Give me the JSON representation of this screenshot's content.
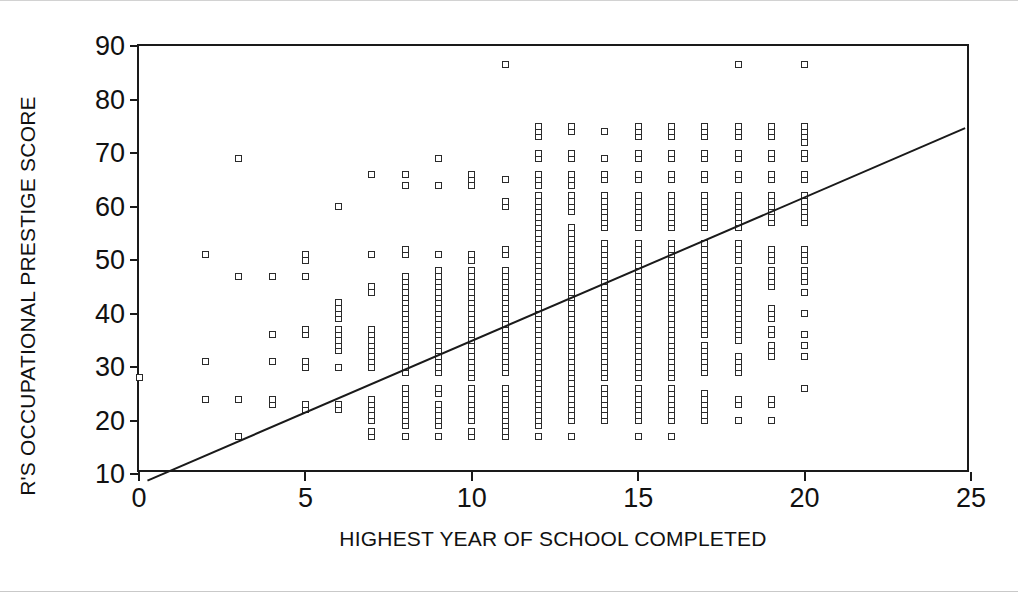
{
  "chart_data": {
    "type": "scatter",
    "title": "",
    "xlabel": "HIGHEST YEAR OF SCHOOL COMPLETED",
    "ylabel": "R'S OCCUPATIONAL PRESTIGE SCORE",
    "xlim": [
      0,
      25
    ],
    "ylim": [
      10,
      90
    ],
    "xticks": [
      0,
      5,
      10,
      15,
      20,
      25
    ],
    "yticks": [
      10,
      20,
      30,
      40,
      50,
      60,
      70,
      80,
      90
    ],
    "grid": false,
    "legend": null,
    "marker": "open-square",
    "marker_color": "#2b2b2b",
    "regression_line": {
      "label": "fit-line",
      "x_start": 0.2,
      "y_start": 8.0,
      "x_end": 25.0,
      "y_end": 74.5,
      "slope": 2.68,
      "intercept": 7.5,
      "color": "#1a1a1a"
    },
    "columns": [
      {
        "x": 0,
        "values": [
          28
        ]
      },
      {
        "x": 2,
        "values": [
          24,
          31,
          51
        ]
      },
      {
        "x": 3,
        "values": [
          17,
          24,
          47,
          69
        ]
      },
      {
        "x": 4,
        "values": [
          23,
          24,
          31,
          36,
          47
        ]
      },
      {
        "x": 5,
        "values": [
          22,
          23,
          30,
          31,
          36,
          37,
          47,
          50,
          51
        ]
      },
      {
        "x": 6,
        "values": [
          22,
          23,
          30,
          33,
          34,
          35,
          36,
          37,
          39,
          40,
          41,
          42,
          60
        ]
      },
      {
        "x": 7,
        "values": [
          17,
          18,
          20,
          21,
          22,
          23,
          24,
          30,
          31,
          32,
          33,
          34,
          35,
          36,
          37,
          44,
          45,
          51,
          66
        ]
      },
      {
        "x": 8,
        "values": [
          17,
          19,
          20,
          21,
          22,
          23,
          24,
          25,
          26,
          29,
          30,
          31,
          32,
          33,
          34,
          35,
          36,
          37,
          38,
          39,
          40,
          41,
          42,
          43,
          44,
          45,
          46,
          47,
          51,
          52,
          64,
          66
        ]
      },
      {
        "x": 9,
        "values": [
          17,
          19,
          20,
          21,
          22,
          23,
          25,
          26,
          29,
          30,
          31,
          32,
          33,
          34,
          35,
          36,
          37,
          38,
          39,
          40,
          41,
          42,
          43,
          44,
          45,
          46,
          47,
          48,
          51,
          64,
          69
        ]
      },
      {
        "x": 10,
        "values": [
          17,
          18,
          20,
          21,
          22,
          23,
          24,
          25,
          26,
          28,
          29,
          30,
          31,
          32,
          33,
          34,
          35,
          36,
          37,
          38,
          39,
          40,
          41,
          42,
          43,
          44,
          45,
          46,
          47,
          48,
          50,
          51,
          64,
          65,
          66
        ]
      },
      {
        "x": 11,
        "values": [
          17,
          18,
          19,
          20,
          21,
          22,
          23,
          24,
          25,
          26,
          29,
          30,
          31,
          32,
          33,
          34,
          35,
          36,
          37,
          38,
          39,
          40,
          41,
          42,
          43,
          44,
          45,
          46,
          47,
          48,
          51,
          52,
          60,
          61,
          65,
          86.5
        ]
      },
      {
        "x": 12,
        "values": [
          17,
          19,
          20,
          21,
          22,
          23,
          24,
          25,
          26,
          27,
          28,
          29,
          30,
          31,
          32,
          33,
          34,
          35,
          36,
          37,
          38,
          39,
          40,
          41,
          42,
          43,
          44,
          45,
          46,
          47,
          48,
          49,
          50,
          51,
          52,
          53,
          54,
          55,
          56,
          57,
          58,
          59,
          60,
          61,
          62,
          64,
          65,
          66,
          69,
          70,
          73,
          74,
          75
        ]
      },
      {
        "x": 13,
        "values": [
          17,
          20,
          21,
          22,
          23,
          24,
          25,
          26,
          27,
          28,
          29,
          30,
          31,
          32,
          33,
          34,
          35,
          36,
          37,
          38,
          39,
          40,
          41,
          42,
          43,
          44,
          45,
          46,
          47,
          48,
          49,
          50,
          51,
          52,
          53,
          54,
          55,
          56,
          59,
          60,
          61,
          62,
          64,
          65,
          66,
          69,
          70,
          74,
          75
        ]
      },
      {
        "x": 14,
        "values": [
          20,
          21,
          22,
          23,
          24,
          25,
          26,
          28,
          29,
          30,
          31,
          32,
          33,
          34,
          35,
          36,
          37,
          38,
          39,
          40,
          41,
          42,
          43,
          44,
          45,
          46,
          47,
          48,
          49,
          50,
          51,
          52,
          53,
          56,
          57,
          58,
          59,
          60,
          61,
          62,
          65,
          66,
          69,
          74
        ]
      },
      {
        "x": 15,
        "values": [
          17,
          20,
          21,
          22,
          23,
          24,
          25,
          26,
          28,
          29,
          30,
          31,
          32,
          33,
          34,
          35,
          36,
          37,
          38,
          39,
          40,
          41,
          42,
          43,
          44,
          45,
          46,
          47,
          48,
          49,
          50,
          51,
          52,
          53,
          56,
          57,
          58,
          59,
          60,
          61,
          62,
          65,
          66,
          69,
          70,
          73,
          74,
          75
        ]
      },
      {
        "x": 16,
        "values": [
          17,
          20,
          21,
          22,
          23,
          24,
          25,
          26,
          28,
          29,
          30,
          31,
          32,
          33,
          34,
          35,
          36,
          37,
          38,
          39,
          40,
          41,
          42,
          43,
          44,
          45,
          46,
          47,
          48,
          49,
          50,
          51,
          52,
          53,
          56,
          57,
          58,
          59,
          60,
          61,
          62,
          65,
          66,
          69,
          70,
          73,
          74,
          75
        ]
      },
      {
        "x": 17,
        "values": [
          20,
          21,
          22,
          23,
          24,
          25,
          29,
          30,
          31,
          32,
          33,
          34,
          36,
          37,
          38,
          39,
          40,
          41,
          42,
          43,
          44,
          45,
          46,
          47,
          48,
          49,
          50,
          51,
          52,
          53,
          56,
          57,
          58,
          59,
          60,
          61,
          62,
          65,
          66,
          69,
          70,
          73,
          74,
          75
        ]
      },
      {
        "x": 18,
        "values": [
          20,
          23,
          24,
          29,
          30,
          31,
          32,
          35,
          36,
          37,
          38,
          39,
          40,
          41,
          42,
          43,
          44,
          45,
          46,
          47,
          48,
          50,
          51,
          52,
          53,
          56,
          57,
          58,
          59,
          60,
          61,
          62,
          65,
          66,
          69,
          70,
          73,
          74,
          75,
          86.5
        ]
      },
      {
        "x": 19,
        "values": [
          20,
          23,
          24,
          32,
          33,
          34,
          36,
          37,
          39,
          40,
          41,
          45,
          46,
          47,
          48,
          50,
          51,
          52,
          57,
          58,
          59,
          60,
          61,
          62,
          65,
          66,
          69,
          70,
          73,
          74,
          75
        ]
      },
      {
        "x": 20,
        "values": [
          26,
          32,
          34,
          36,
          40,
          44,
          46,
          47,
          48,
          50,
          51,
          52,
          57,
          58,
          59,
          60,
          61,
          62,
          65,
          66,
          69,
          70,
          72,
          73,
          74,
          75,
          86.5
        ]
      }
    ]
  }
}
